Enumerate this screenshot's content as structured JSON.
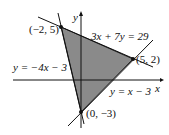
{
  "diagram": {
    "axes": {
      "x_label": "x",
      "y_label": "y"
    },
    "lines": [
      {
        "equation": "3x + 7y = 29"
      },
      {
        "equation": "y = −4x − 3"
      },
      {
        "equation": "y = x − 3"
      }
    ],
    "vertices": [
      {
        "label": "(−2, 5)"
      },
      {
        "label": "(5, 2)"
      },
      {
        "label": "(0, −3)"
      }
    ],
    "colors": {
      "region": "#8a8a8a",
      "line": "#111111"
    }
  }
}
